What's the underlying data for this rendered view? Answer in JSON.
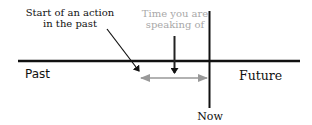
{
  "diagram": {
    "labels": {
      "start_action_line1": "Start of an action",
      "start_action_line2": "in the past",
      "time_speaking_line1": "Time you are",
      "time_speaking_line2": "speaking of",
      "past": "Past",
      "future": "Future",
      "now": "Now"
    },
    "colors": {
      "line": "#111111",
      "gray_arrow": "#999999",
      "gray_text": "#a8a8a8"
    },
    "elements": {
      "timeline": "horizontal-line",
      "now_marker": "vertical-line",
      "duration_arrow": "double-headed-gray-arrow",
      "start_pointer": "diagonal-arrow",
      "reference_pointer": "down-arrow"
    }
  }
}
